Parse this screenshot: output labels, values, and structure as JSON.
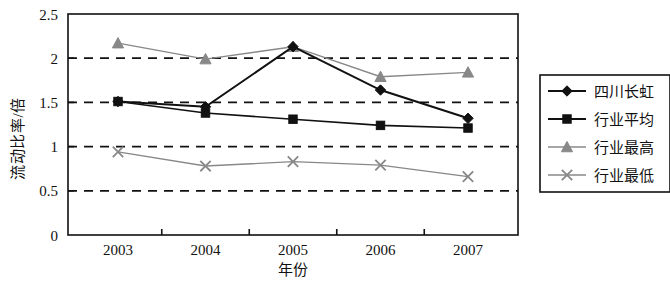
{
  "chart_data": {
    "type": "line",
    "title": "",
    "xlabel": "年份",
    "ylabel": "流动比率/倍",
    "categories": [
      "2003",
      "2004",
      "2005",
      "2006",
      "2007"
    ],
    "x_ticklabels": [
      "2003",
      "2004",
      "2005",
      "2006",
      "2007"
    ],
    "y_ticklabels": [
      "0",
      "0.5",
      "1",
      "1.5",
      "2",
      "2.5"
    ],
    "y_tickvalues": [
      0,
      0.5,
      1,
      1.5,
      2,
      2.5
    ],
    "ylim": [
      0,
      2.5
    ],
    "grid": "horizontal-dashed",
    "legend_position": "right",
    "series": [
      {
        "name": "四川长虹",
        "values": [
          1.51,
          1.45,
          2.13,
          1.64,
          1.32
        ],
        "marker": "diamond",
        "color": "#111111",
        "line_width": 2.0
      },
      {
        "name": "行业平均",
        "values": [
          1.51,
          1.38,
          1.31,
          1.24,
          1.21
        ],
        "marker": "square",
        "color": "#111111",
        "line_width": 1.6
      },
      {
        "name": "行业最高",
        "values": [
          2.17,
          1.99,
          2.13,
          1.79,
          1.84
        ],
        "marker": "triangle",
        "color": "#888888",
        "line_width": 1.4
      },
      {
        "name": "行业最低",
        "values": [
          0.94,
          0.78,
          0.83,
          0.79,
          0.66
        ],
        "marker": "cross",
        "color": "#888888",
        "line_width": 1.4
      }
    ],
    "gridline_values": [
      0.5,
      1,
      1.5,
      2
    ],
    "axis_color": "#111111",
    "background": "#ffffff"
  },
  "legend": {
    "items": [
      {
        "label": "四川长虹",
        "marker": "diamond",
        "color": "#111111"
      },
      {
        "label": "行业平均",
        "marker": "square",
        "color": "#111111"
      },
      {
        "label": "行业最高",
        "marker": "triangle",
        "color": "#888888"
      },
      {
        "label": "行业最低",
        "marker": "cross",
        "color": "#888888"
      }
    ]
  }
}
